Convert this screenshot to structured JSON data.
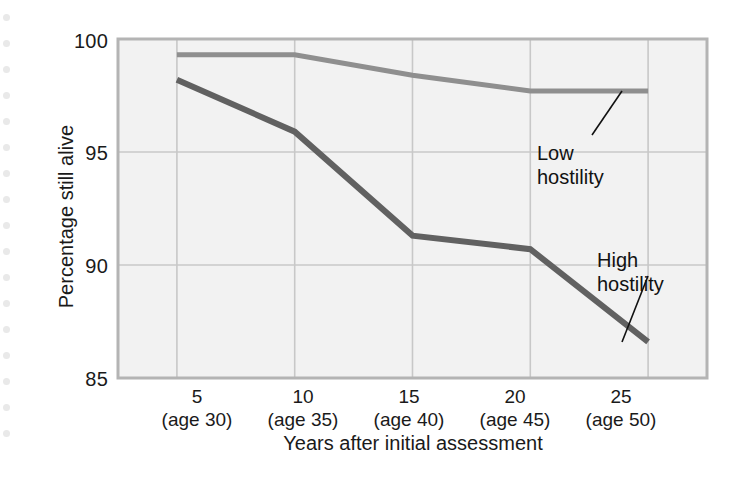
{
  "figure": {
    "background_color": "#ffffff",
    "plot_background_color": "#f2f2f2",
    "axis_color": "#b4b4b4",
    "grid_color": "#c8c8c8"
  },
  "decoration": {
    "punch_holes_name": "punch-hole-dots",
    "punch_hole_count": 17,
    "punch_hole_color": "#e9e9e9"
  },
  "chart_data": {
    "type": "line",
    "title": "",
    "xlabel": "Years after initial assessment",
    "ylabel": "Percentage still alive",
    "x": [
      5,
      10,
      15,
      20,
      25
    ],
    "categories": [
      "5",
      "10",
      "15",
      "20",
      "25"
    ],
    "xtick_labels": [
      {
        "value": "5",
        "sub": "(age 30)"
      },
      {
        "value": "10",
        "sub": "(age 35)"
      },
      {
        "value": "15",
        "sub": "(age 40)"
      },
      {
        "value": "20",
        "sub": "(age 45)"
      },
      {
        "value": "25",
        "sub": "(age 50)"
      }
    ],
    "ytick_labels": [
      "100",
      "95",
      "90",
      "85"
    ],
    "yticks": [
      100,
      95,
      90,
      85
    ],
    "ylim": [
      85,
      100
    ],
    "xlim": [
      2.5,
      27.5
    ],
    "grid": true,
    "legend": "annotations",
    "series": [
      {
        "name": "Low hostility",
        "color": "#8f8f8f",
        "values": [
          99.3,
          99.3,
          98.4,
          97.7,
          97.7
        ]
      },
      {
        "name": "High hostility",
        "color": "#616161",
        "values": [
          98.2,
          95.9,
          91.3,
          90.7,
          86.6
        ]
      }
    ],
    "annotations": [
      {
        "name": "low-hostility-label",
        "text_line1": "Low",
        "text_line2": "hostility",
        "points_to_series": "Low hostility",
        "points_to_x": 25
      },
      {
        "name": "high-hostility-label",
        "text_line1": "High",
        "text_line2": "hostility",
        "points_to_series": "High hostility",
        "points_to_x": 25
      }
    ]
  }
}
